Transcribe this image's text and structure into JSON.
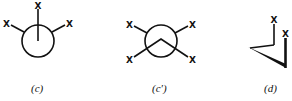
{
  "figures": [
    {
      "id": "c",
      "caption": "(c)",
      "type": "newman-projection",
      "substituent_labels": [
        "X",
        "X",
        "X"
      ]
    },
    {
      "id": "c-prime",
      "caption": "(c′)",
      "type": "newman-projection",
      "substituent_labels": [
        "X",
        "X",
        "X",
        "X"
      ]
    },
    {
      "id": "d",
      "caption": "(d)",
      "type": "perspective-structure",
      "substituent_labels": [
        "X",
        "X"
      ]
    }
  ],
  "colors": {
    "stroke": "#111111",
    "background": "#ffffff"
  }
}
